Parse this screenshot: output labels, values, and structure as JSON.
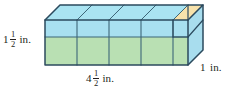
{
  "figure": {
    "shape": "rectangular-prism",
    "projection": "oblique",
    "colors": {
      "front_bottom_green": "#b9e0b3",
      "front_top_blue": "#a8e0f0",
      "top_face_blue": "#aae4f2",
      "right_face_blue": "#a8ddee",
      "partial_cube_tan": "#f7e2ab",
      "outline": "#2b4a5e",
      "inner_line": "#3d6678",
      "text": "#231f20",
      "background": "#ffffff"
    },
    "labels": {
      "height": {
        "name": "height-label",
        "whole": "1",
        "numerator": "1",
        "denominator": "2",
        "unit": "in.",
        "value": 1.5
      },
      "length": {
        "name": "length-label",
        "whole": "4",
        "numerator": "1",
        "denominator": "2",
        "unit": "in.",
        "value": 4.5
      },
      "depth": {
        "name": "depth-label",
        "whole": "1",
        "numerator": "",
        "denominator": "",
        "unit": "in.",
        "value": 1
      }
    },
    "grid": {
      "columns_full": 4,
      "columns_partial": 1,
      "rows_full": 1,
      "rows_partial": 1,
      "depth_units": 1
    }
  }
}
